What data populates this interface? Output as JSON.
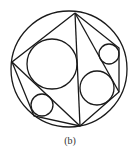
{
  "caption": "(b)",
  "colors": {
    "stroke": "#1a1a1a",
    "background": "#ffffff",
    "caption": "#333333"
  },
  "geometry": {
    "outer_circle": {
      "cx": 69,
      "cy": 69,
      "r": 58
    },
    "vertices": {
      "top": [
        75,
        13
      ],
      "left": [
        12,
        62
      ],
      "lower_left": [
        34,
        116
      ],
      "bottom": [
        80,
        126
      ],
      "lower_right": [
        119,
        92
      ],
      "upper_right": [
        119,
        48
      ]
    },
    "inscribed_circles": [
      {
        "name": "large-left",
        "cx": 52,
        "cy": 64,
        "r": 25
      },
      {
        "name": "right",
        "cx": 97,
        "cy": 88,
        "r": 17
      },
      {
        "name": "small-upper-right",
        "cx": 109,
        "cy": 54,
        "r": 10
      },
      {
        "name": "small-lower-left",
        "cx": 42,
        "cy": 105,
        "r": 11
      }
    ]
  }
}
